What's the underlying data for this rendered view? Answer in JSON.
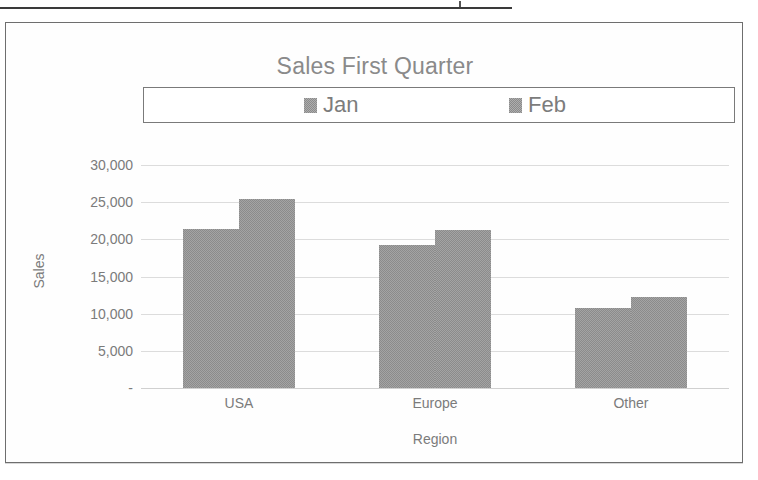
{
  "page": {
    "rule_present": true
  },
  "chart_data": {
    "type": "bar",
    "title": "Sales First Quarter",
    "xlabel": "Region",
    "ylabel": "Sales",
    "categories": [
      "USA",
      "Europe",
      "Other"
    ],
    "series": [
      {
        "name": "Jan",
        "values": [
          21400,
          19200,
          10800
        ],
        "color": "#8b8b8b"
      },
      {
        "name": "Feb",
        "values": [
          25400,
          21300,
          12300
        ],
        "color": "#8b8b8b"
      }
    ],
    "ylim": [
      0,
      30000
    ],
    "ytick_values": [
      30000,
      25000,
      20000,
      15000,
      10000,
      5000,
      0
    ],
    "ytick_labels": [
      "30,000",
      "25,000",
      "20,000",
      "15,000",
      "10,000",
      "5,000",
      "-"
    ],
    "grid": true,
    "legend_position": "top",
    "legend_border": true,
    "title_color": "#8a8a8a",
    "axis_text_color": "#7b7b7b",
    "gridline_color": "#dcdcdc",
    "plot_background": "#ffffff",
    "frame_border_color": "#6e6e6e"
  }
}
